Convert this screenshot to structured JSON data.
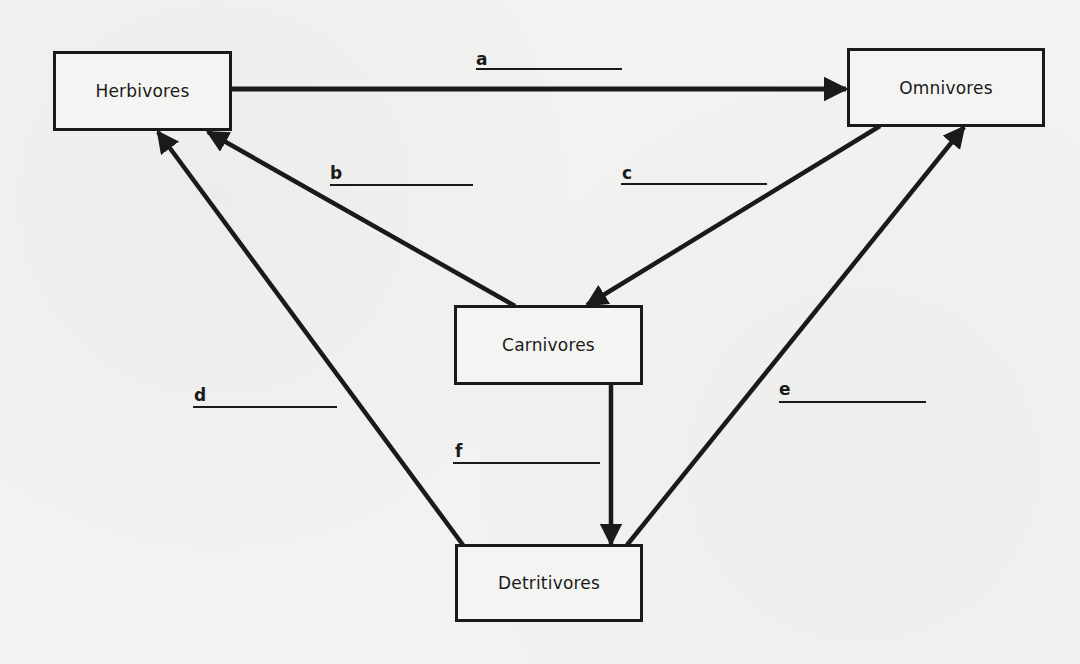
{
  "diagram": {
    "type": "food-web",
    "nodes": [
      {
        "id": "herbivores",
        "label": "Herbivores"
      },
      {
        "id": "omnivores",
        "label": "Omnivores"
      },
      {
        "id": "carnivores",
        "label": "Carnivores"
      },
      {
        "id": "detritivores",
        "label": "Detritivores"
      }
    ],
    "edges": [
      {
        "id": "a",
        "label": "a",
        "from": "herbivores",
        "to": "omnivores",
        "answer_blank": ""
      },
      {
        "id": "b",
        "label": "b",
        "from": "carnivores",
        "to": "herbivores",
        "answer_blank": ""
      },
      {
        "id": "c",
        "label": "c",
        "from": "omnivores",
        "to": "carnivores",
        "answer_blank": ""
      },
      {
        "id": "d",
        "label": "d",
        "from": "detritivores",
        "to": "herbivores",
        "answer_blank": ""
      },
      {
        "id": "e",
        "label": "e",
        "from": "detritivores",
        "to": "omnivores",
        "answer_blank": ""
      },
      {
        "id": "f",
        "label": "f",
        "from": "carnivores",
        "to": "detritivores",
        "answer_blank": ""
      }
    ]
  },
  "colors": {
    "ink": "#1a1a1a",
    "paper": "#f2f2f0"
  }
}
